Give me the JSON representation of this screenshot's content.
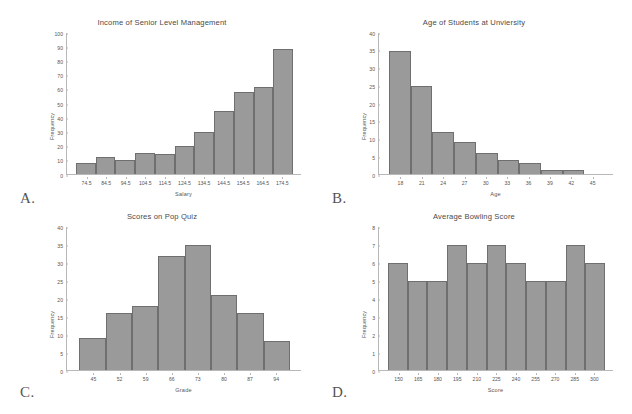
{
  "page": {
    "background": "#ffffff",
    "bar_fill": "#9a9a9a",
    "bar_stroke": "#6f6f6f",
    "axis_color": "#b8b8b8",
    "text_color": "#555555"
  },
  "panels": [
    {
      "letter": "A.",
      "chart_data": {
        "type": "bar",
        "title": "Income of Senior Level Management",
        "xlabel": "Salary",
        "ylabel": "Frequency",
        "categories": [
          "74.5",
          "84.5",
          "94.5",
          "104.5",
          "114.5",
          "124.5",
          "134.5",
          "144.5",
          "154.5",
          "164.5",
          "174.5"
        ],
        "values": [
          8,
          12,
          10,
          15,
          14,
          20,
          30,
          45,
          58,
          62,
          89
        ],
        "yticks": [
          0,
          10,
          20,
          30,
          40,
          50,
          60,
          70,
          80,
          90,
          100
        ],
        "ylim": [
          0,
          100
        ],
        "grid": false,
        "legend": false
      }
    },
    {
      "letter": "B.",
      "chart_data": {
        "type": "bar",
        "title": "Age of Students at Unviersity",
        "xlabel": "Age",
        "ylabel": "Frequency",
        "categories": [
          "18",
          "21",
          "24",
          "27",
          "30",
          "33",
          "36",
          "39",
          "42",
          "45"
        ],
        "values": [
          35,
          25,
          12,
          9,
          6,
          4,
          3,
          1,
          1
        ],
        "yticks": [
          0,
          5,
          10,
          15,
          20,
          25,
          30,
          35,
          40
        ],
        "ylim": [
          0,
          40
        ],
        "grid": false,
        "legend": false
      }
    },
    {
      "letter": "C.",
      "chart_data": {
        "type": "bar",
        "title": "Scores on Pop Quiz",
        "xlabel": "Grade",
        "ylabel": "Frequency",
        "categories": [
          "45",
          "52",
          "59",
          "66",
          "73",
          "80",
          "87",
          "94"
        ],
        "values": [
          9,
          16,
          18,
          32,
          35,
          21,
          16,
          8
        ],
        "yticks": [
          0,
          5,
          10,
          15,
          20,
          25,
          30,
          35,
          40
        ],
        "ylim": [
          0,
          40
        ],
        "grid": false,
        "legend": false
      }
    },
    {
      "letter": "D.",
      "chart_data": {
        "type": "bar",
        "title": "Average Bowling Score",
        "xlabel": "Score",
        "ylabel": "Frequency",
        "categories": [
          "150",
          "165",
          "180",
          "195",
          "210",
          "225",
          "240",
          "255",
          "270",
          "285",
          "300"
        ],
        "values": [
          6,
          5,
          5,
          7,
          6,
          7,
          6,
          5,
          5,
          7,
          6
        ],
        "yticks": [
          0,
          1,
          2,
          3,
          4,
          5,
          6,
          7,
          8
        ],
        "ylim": [
          0,
          8
        ],
        "grid": false,
        "legend": false
      }
    }
  ]
}
